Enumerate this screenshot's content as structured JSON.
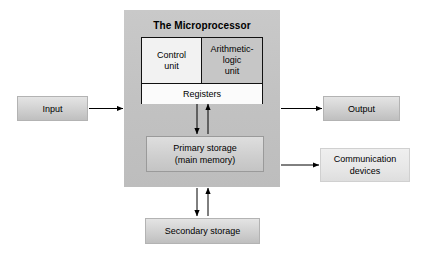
{
  "diagram": {
    "cpu": {
      "panel_title": "The Microprocessor",
      "control_unit": "Control\nunit",
      "control_unit_line1": "Control",
      "control_unit_line2": "unit",
      "alu_line1": "Arithmetic-",
      "alu_line2": "logic",
      "alu_line3": "unit",
      "registers": "Registers",
      "primary_storage_line1": "Primary storage",
      "primary_storage_line2": "(main memory)"
    },
    "external": {
      "input": "Input",
      "output": "Output",
      "communication_line1": "Communication",
      "communication_line2": "devices",
      "secondary_storage": "Secondary storage"
    },
    "colors": {
      "cpu_panel": "#c4c4c4",
      "alu_fill": "#c6c6c6",
      "control_unit_fill": "#f2f2f2",
      "registers_fill": "#fbfbfb",
      "external_box_fill": "#d2d2d2",
      "arrow": "#000000",
      "background": "#ffffff"
    },
    "connections": [
      {
        "name": "input-to-cpu",
        "from": "Input",
        "to": "The Microprocessor",
        "direction": "one-way"
      },
      {
        "name": "cpu-to-output",
        "from": "The Microprocessor",
        "to": "Output",
        "direction": "one-way"
      },
      {
        "name": "cpu-to-communication-devices",
        "from": "The Microprocessor",
        "to": "Communication devices",
        "direction": "one-way"
      },
      {
        "name": "registers-to-primary-storage",
        "from": "Registers",
        "to": "Primary storage",
        "direction": "two-way"
      },
      {
        "name": "primary-to-secondary-storage",
        "from": "Primary storage",
        "to": "Secondary storage",
        "direction": "two-way"
      }
    ]
  }
}
